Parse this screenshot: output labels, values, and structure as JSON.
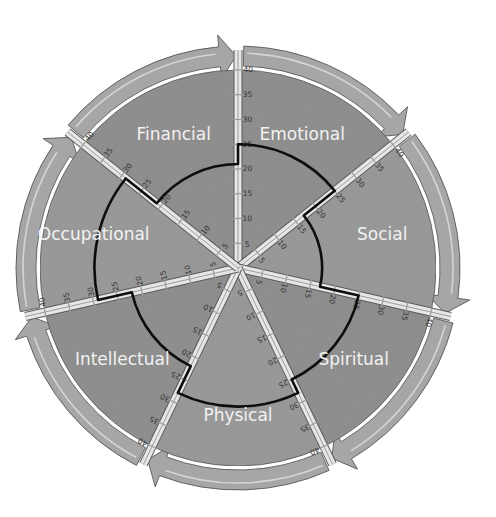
{
  "diagram": {
    "type": "wellness-wheel",
    "center": [
      238,
      268
    ],
    "scale": {
      "min": 0,
      "max": 40,
      "step": 5,
      "ticks": [
        "5",
        "10",
        "15",
        "20",
        "25",
        "30",
        "35",
        "40"
      ]
    },
    "segments": [
      {
        "name": "Emotional",
        "value": 25
      },
      {
        "name": "Social",
        "value": 17
      },
      {
        "name": "Spiritual",
        "value": 25
      },
      {
        "name": "Physical",
        "value": 28
      },
      {
        "name": "Intellectual",
        "value": 22
      },
      {
        "name": "Occupational",
        "value": 29
      },
      {
        "name": "Financial",
        "value": 21
      }
    ],
    "colors": {
      "segment_fill": "#8f8f8f",
      "segment_fill_alt": "#999999",
      "arrow_fill": "#a6a6a6",
      "spoke": "#e6e6e6",
      "data_line": "#0d0d0d",
      "label": "#f2f2f2",
      "tick_text": "#333333"
    }
  },
  "chart_data": {
    "type": "radar",
    "title": "",
    "categories": [
      "Emotional",
      "Social",
      "Spiritual",
      "Physical",
      "Intellectual",
      "Occupational",
      "Financial"
    ],
    "values": [
      25,
      17,
      25,
      28,
      22,
      29,
      21
    ],
    "rlim": [
      0,
      40
    ],
    "tick_step": 5,
    "grid": false,
    "legend": "none"
  }
}
